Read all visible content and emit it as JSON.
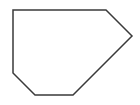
{
  "figure": {
    "name": "hexagon-outline",
    "background_color": "#ffffff",
    "stroke_color": "#3a3a3a",
    "fill_color": "#ffffff",
    "stroke_width": 1.5,
    "canvas": {
      "width": 140,
      "height": 105
    },
    "shape": {
      "type": "polygon",
      "sides": 6,
      "label": "hexagon",
      "points": "13,10 106,10 132,36 73,95 35,95 13,73",
      "vertices": [
        {
          "name": "top-left",
          "x": 13,
          "y": 10
        },
        {
          "name": "top-right",
          "x": 106,
          "y": 10
        },
        {
          "name": "right",
          "x": 132,
          "y": 36
        },
        {
          "name": "bottom-right",
          "x": 73,
          "y": 95
        },
        {
          "name": "bottom-left",
          "x": 35,
          "y": 95
        },
        {
          "name": "left",
          "x": 13,
          "y": 73
        }
      ]
    }
  }
}
